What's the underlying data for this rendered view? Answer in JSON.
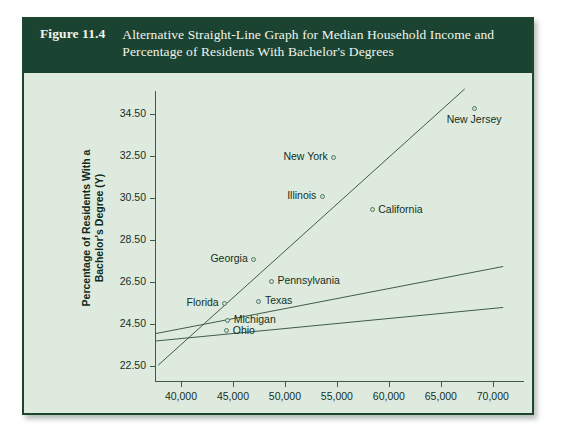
{
  "figure": {
    "number": "Figure 11.4",
    "caption": "Alternative Straight-Line Graph for Median Household Income and Percentage of Residents With Bachelor's Degrees"
  },
  "colors": {
    "banner": "#1a4431",
    "panel": "#dfeadf",
    "border": "#1d4630",
    "axis": "#3f5a4a",
    "marker_edge": "#4d7a63",
    "text": "#10301d"
  },
  "chart_data": {
    "type": "scatter",
    "title": "Alternative Straight-Line Graph for Median Household Income and Percentage of Residents With Bachelor's Degrees",
    "xlabel": "Median Household Income (X)",
    "ylabel": "Percentage of Residents With a Bachelor's Degree (Y)",
    "xlim": [
      37500,
      73000
    ],
    "ylim": [
      21.8,
      35.6
    ],
    "xticks": [
      40000,
      45000,
      50000,
      55000,
      60000,
      65000,
      70000
    ],
    "xticklabels": [
      "40,000",
      "45,000",
      "50,000",
      "55,000",
      "60,000",
      "65,000",
      "70,000"
    ],
    "yticks": [
      22.5,
      24.5,
      26.5,
      28.5,
      30.5,
      32.5,
      34.5
    ],
    "yticklabels": [
      "22.50",
      "24.50",
      "26.50",
      "28.50",
      "30.50",
      "32.50",
      "34.50"
    ],
    "grid": false,
    "legend": false,
    "points": [
      {
        "label": "New Jersey",
        "x": 68200,
        "y": 34.75,
        "label_pos": "below"
      },
      {
        "label": "New York",
        "x": 54700,
        "y": 32.45,
        "label_pos": "left"
      },
      {
        "label": "Illinois",
        "x": 53600,
        "y": 30.6,
        "label_pos": "left"
      },
      {
        "label": "California",
        "x": 58400,
        "y": 29.95,
        "label_pos": "right"
      },
      {
        "label": "Georgia",
        "x": 47000,
        "y": 27.6,
        "label_pos": "left"
      },
      {
        "label": "Pennsylvania",
        "x": 48700,
        "y": 26.55,
        "label_pos": "right"
      },
      {
        "label": "Texas",
        "x": 47500,
        "y": 25.6,
        "label_pos": "right"
      },
      {
        "label": "Florida",
        "x": 44200,
        "y": 25.5,
        "label_pos": "left"
      },
      {
        "label": "Michigan",
        "x": 44500,
        "y": 24.7,
        "label_pos": "right"
      },
      {
        "label": "Ohio",
        "x": 44400,
        "y": 24.2,
        "label_pos": "right"
      }
    ],
    "lines": [
      {
        "name": "steep-line",
        "x1": 37800,
        "y1": 22.55,
        "x2": 67300,
        "y2": 35.7
      },
      {
        "name": "middle-line",
        "x1": 37500,
        "y1": 24.05,
        "x2": 71000,
        "y2": 27.25
      },
      {
        "name": "shallow-line",
        "x1": 37500,
        "y1": 23.7,
        "x2": 71000,
        "y2": 25.3
      }
    ]
  }
}
